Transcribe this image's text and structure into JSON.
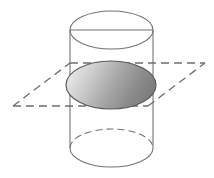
{
  "figure": {
    "background_color": "#ffffff",
    "canvas": {
      "width": 214,
      "height": 178
    }
  },
  "geometry": {
    "cylinder": {
      "label": "cylinder",
      "left_x": 70,
      "right_x": 153,
      "axis_x": 111.5,
      "radius_x": 41.5,
      "ellipse_radius_y": 19,
      "top_center_y": 30,
      "bottom_center_y": 148,
      "stroke_color": "#737373",
      "stroke_width": 1.1,
      "fill": "none"
    },
    "top_ellipse": {
      "label": "top-rim",
      "center_x": 111.5,
      "center_y": 30,
      "rx": 41.5,
      "ry": 19,
      "style": "solid",
      "stroke_color": "#737373"
    },
    "top_chord": {
      "label": "top-diameter-chord",
      "x1": 70,
      "y1": 30,
      "x2": 153,
      "y2": 30,
      "style": "solid",
      "stroke_color": "#737373"
    },
    "bottom_ellipse": {
      "label": "bottom-rim",
      "center_x": 111.5,
      "center_y": 148,
      "rx": 41.5,
      "ry": 19,
      "front_style": "solid",
      "back_style": "dashed",
      "stroke_color": "#737373",
      "dash_pattern": "7,4"
    },
    "plane": {
      "label": "cutting-plane",
      "style": "dashed",
      "stroke_color": "#6e6e6e",
      "stroke_width": 1.3,
      "dash_pattern": "8,5",
      "corners": [
        {
          "name": "left",
          "x": 13,
          "y": 106
        },
        {
          "name": "top",
          "x": 115,
          "y": 63
        },
        {
          "name": "right",
          "x": 205,
          "y": 63
        },
        {
          "name": "bottom",
          "x": 103,
          "y": 106
        }
      ],
      "vertices": [
        {
          "name": "west",
          "x": 13,
          "y": 106
        },
        {
          "name": "north",
          "x": 70,
          "y": 63
        },
        {
          "name": "east",
          "x": 205,
          "y": 63
        },
        {
          "name": "south",
          "x": 148,
          "y": 106
        }
      ]
    },
    "cross_section": {
      "label": "elliptical-cross-section",
      "center_x": 111,
      "center_y": 85,
      "rx": 45,
      "ry": 24,
      "stroke_color": "#5a5a5a",
      "stroke_width": 1.2,
      "gradient": {
        "type": "linear",
        "direction": "left-to-right",
        "stops": [
          {
            "offset": "0%",
            "color": "#e8e8e8"
          },
          {
            "offset": "22%",
            "color": "#cfcfcf"
          },
          {
            "offset": "50%",
            "color": "#a9a9a9"
          },
          {
            "offset": "78%",
            "color": "#8a8a8a"
          },
          {
            "offset": "100%",
            "color": "#7a7a7a"
          }
        ]
      }
    }
  },
  "colors": {
    "background": "#ffffff",
    "outline": "#737373",
    "dashed_plane": "#6e6e6e",
    "shade_light": "#e8e8e8",
    "shade_mid": "#a9a9a9",
    "shade_dark": "#7a7a7a"
  }
}
